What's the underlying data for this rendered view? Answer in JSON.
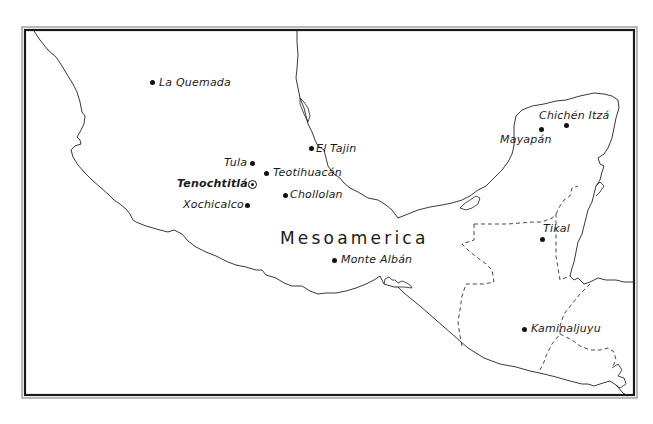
{
  "map": {
    "region_title": "Mesoamerica",
    "colors": {
      "background": "#ffffff",
      "ink": "#1a1a1a",
      "frame_outer": "#8a8a8a",
      "frame_inner": "#1a1a1a"
    },
    "legend_symbols": {
      "site": "dot",
      "capital": "circled-star"
    },
    "sites": [
      {
        "name": "La Quemada"
      },
      {
        "name": "El Tajin"
      },
      {
        "name": "Tula"
      },
      {
        "name": "Teotihuacán"
      },
      {
        "name": "Tenochtitlán",
        "capital": true
      },
      {
        "name": "Chollolan"
      },
      {
        "name": "Xochicalco"
      },
      {
        "name": "Monte Albán"
      },
      {
        "name": "Chichén Itzá"
      },
      {
        "name": "Mayapán"
      },
      {
        "name": "Tikal"
      },
      {
        "name": "Kaminaljuyu"
      }
    ]
  }
}
